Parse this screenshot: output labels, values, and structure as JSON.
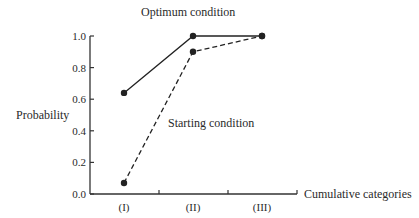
{
  "chart_data": {
    "type": "line",
    "title": "",
    "xlabel": "Cumulative categories",
    "ylabel": "Probability",
    "ylim": [
      0.0,
      1.0
    ],
    "yticks": [
      "0.0",
      "0.2",
      "0.4",
      "0.6",
      "0.8",
      "1.0"
    ],
    "categories": [
      "(I)",
      "(II)",
      "(III)"
    ],
    "grid": false,
    "series": [
      {
        "name": "Optimum condition",
        "style": "solid",
        "values": [
          0.64,
          1.0,
          1.0
        ]
      },
      {
        "name": "Starting condition",
        "style": "dashed",
        "values": [
          0.07,
          0.9,
          1.0
        ]
      }
    ],
    "annotations": [
      {
        "text": "Optimum condition",
        "series": 0
      },
      {
        "text": "Starting condition",
        "series": 1
      }
    ],
    "colors": {
      "line": "#222222",
      "axis": "#333333",
      "text": "#2a2a2a"
    }
  }
}
